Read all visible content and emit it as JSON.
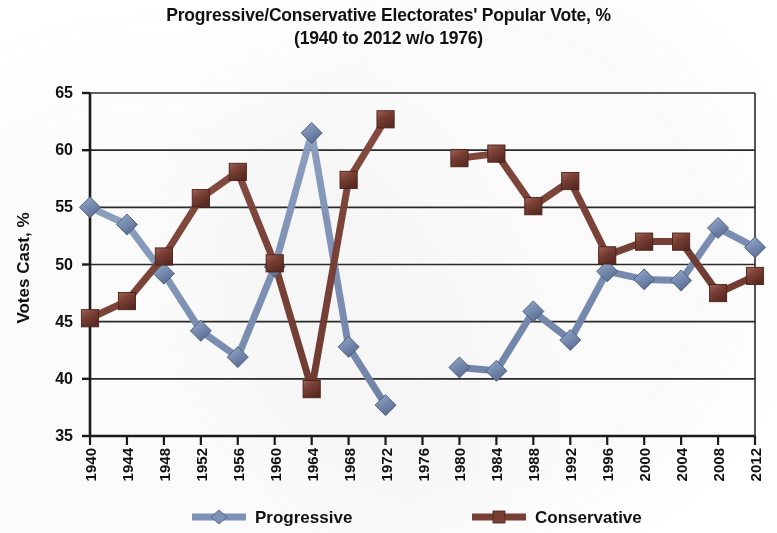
{
  "chart_data": {
    "type": "line",
    "title": "Progressive/Conservative Electorates' Popular Vote, %",
    "subtitle": "(1940 to 2012 w/o 1976)",
    "xlabel": "",
    "ylabel": "Votes Cast, %",
    "ylim": [
      35,
      65
    ],
    "ytick_step": 5,
    "yticks": [
      65,
      60,
      55,
      50,
      45,
      40,
      35
    ],
    "grid": true,
    "legend_position": "bottom",
    "categories": [
      "1940",
      "1944",
      "1948",
      "1952",
      "1956",
      "1960",
      "1964",
      "1968",
      "1972",
      "1976",
      "1980",
      "1984",
      "1988",
      "1992",
      "1996",
      "2000",
      "2004",
      "2008",
      "2012"
    ],
    "missing_category": "1976",
    "series": [
      {
        "name": "Progressive",
        "color": "#7e93b8",
        "marker": "diamond",
        "values": [
          55.0,
          53.5,
          49.2,
          44.2,
          41.9,
          49.8,
          61.5,
          42.8,
          37.7,
          null,
          41.0,
          40.7,
          45.9,
          43.4,
          49.4,
          48.7,
          48.6,
          53.2,
          51.5
        ]
      },
      {
        "name": "Conservative",
        "color": "#7b4035",
        "marker": "square",
        "values": [
          45.3,
          46.8,
          50.7,
          55.8,
          58.1,
          50.1,
          39.1,
          57.4,
          62.7,
          null,
          59.3,
          59.7,
          55.1,
          57.3,
          50.8,
          52.0,
          52.0,
          47.5,
          49.0
        ]
      }
    ]
  },
  "legend": {
    "items": [
      {
        "label": "Progressive",
        "color": "#7e93b8",
        "marker": "diamond"
      },
      {
        "label": "Conservative",
        "color": "#7b4035",
        "marker": "square"
      }
    ]
  }
}
